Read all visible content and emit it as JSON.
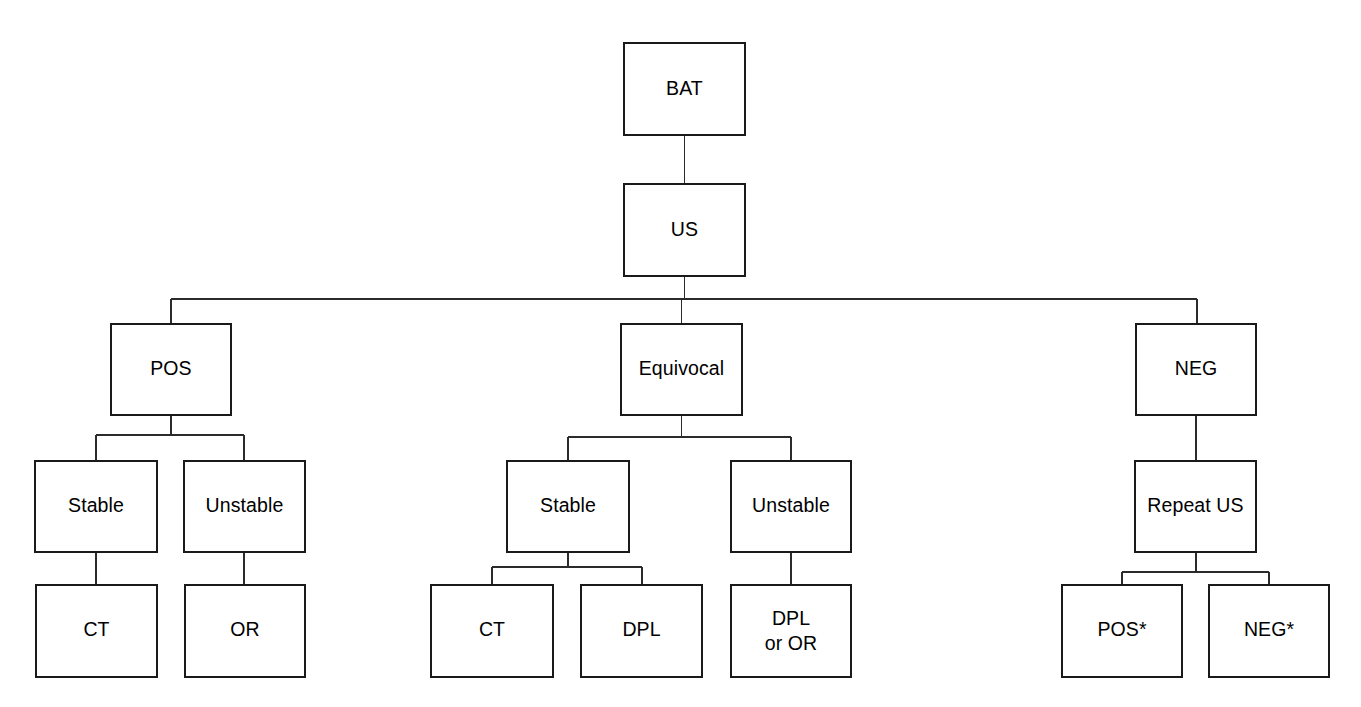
{
  "diagram": {
    "stroke_color": "#1a1a1a",
    "connector_color": "#2b2b2b",
    "background_color": "#ffffff",
    "text_color": "#000000"
  },
  "nodes": {
    "bat": {
      "label": "BAT"
    },
    "us": {
      "label": "US"
    },
    "pos": {
      "label": "POS"
    },
    "equivocal": {
      "label": "Equivocal"
    },
    "neg": {
      "label": "NEG"
    },
    "pos_stable": {
      "label": "Stable"
    },
    "pos_unstable": {
      "label": "Unstable"
    },
    "pos_stable_ct": {
      "label": "CT"
    },
    "pos_unstable_or": {
      "label": "OR"
    },
    "eq_stable": {
      "label": "Stable"
    },
    "eq_unstable": {
      "label": "Unstable"
    },
    "eq_stable_ct": {
      "label": "CT"
    },
    "eq_stable_dpl": {
      "label": "DPL"
    },
    "eq_unstable_dpl_or_line1": {
      "label": "DPL"
    },
    "eq_unstable_dpl_or_line2": {
      "label": "or OR"
    },
    "neg_repeat_us": {
      "label": "Repeat US"
    },
    "neg_repeat_pos": {
      "label": "POS*"
    },
    "neg_repeat_neg": {
      "label": "NEG*"
    }
  }
}
